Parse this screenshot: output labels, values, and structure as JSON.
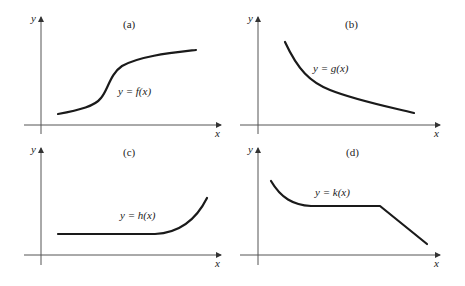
{
  "panels": [
    {
      "id": "a",
      "tag": "(a)",
      "equation": "y = f(x)",
      "x_axis": "x",
      "y_axis": "y",
      "description": "increasing S-shaped curve that levels off"
    },
    {
      "id": "b",
      "tag": "(b)",
      "equation": "y = g(x)",
      "x_axis": "x",
      "y_axis": "y",
      "description": "decreasing convex curve"
    },
    {
      "id": "c",
      "tag": "(c)",
      "equation": "y = h(x)",
      "x_axis": "x",
      "y_axis": "y",
      "description": "constant then increasing sharply"
    },
    {
      "id": "d",
      "tag": "(d)",
      "equation": "y = k(x)",
      "x_axis": "x",
      "y_axis": "y",
      "description": "decreasing curve, constant segment, then linear decrease"
    }
  ],
  "colors": {
    "curve": "#1a1a1a",
    "axis": "#555555",
    "background": "#ffffff"
  }
}
